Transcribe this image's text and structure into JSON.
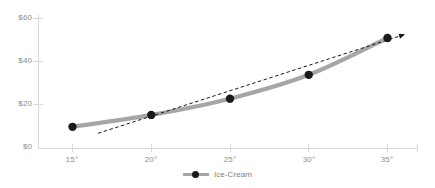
{
  "chart_data": {
    "type": "line",
    "title": "",
    "subtitle": "",
    "xlabel": "",
    "ylabel": "",
    "x": [
      "15°",
      "20°",
      "25°",
      "30°",
      "35°"
    ],
    "x_numeric": [
      15,
      20,
      25,
      30,
      35
    ],
    "categories": [
      "15°",
      "20°",
      "25°",
      "30°",
      "35°"
    ],
    "series": [
      {
        "name": "Ice-Cream",
        "values": [
          10,
          15.5,
          23,
          34,
          51
        ],
        "line_color": "#a6a6a6",
        "marker_color": "#1a1a1a",
        "style": "solid"
      },
      {
        "name": "trendline",
        "values": [
          7,
          15.5,
          26,
          37.5,
          50.5
        ],
        "line_color": "#1a1a1a",
        "style": "dashed",
        "arrow_end": true,
        "visible_in_legend": false
      }
    ],
    "ylim": [
      0,
      60
    ],
    "xlim": [
      15,
      35
    ],
    "y_ticks": [
      0,
      20,
      40,
      60
    ],
    "y_tick_labels": [
      "$0",
      "$20",
      "$40",
      "$60"
    ],
    "x_tick_labels": [
      "15°",
      "20°",
      "25°",
      "30°",
      "35°"
    ],
    "grid": false,
    "legend_position": "bottom",
    "axis_color": "#d9d9d9",
    "text_color": "#8c8c8c"
  },
  "legend": {
    "entries": [
      {
        "label": "Ice-Cream"
      }
    ]
  },
  "y_axis": {
    "labels": [
      "$60",
      "$40",
      "$20",
      "$0"
    ]
  },
  "x_axis": {
    "labels": [
      "15°",
      "20°",
      "25°",
      "30°",
      "35°"
    ]
  }
}
